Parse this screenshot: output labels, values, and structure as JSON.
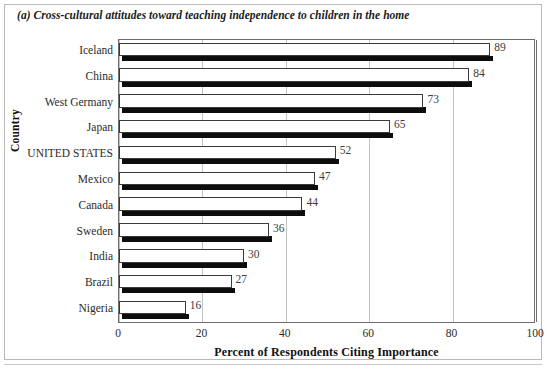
{
  "figure": {
    "caption": "(a) Cross-cultural attitudes toward teaching independence to children in the home"
  },
  "chart_data": {
    "type": "bar",
    "orientation": "horizontal",
    "title": "(a) Cross-cultural attitudes toward teaching independence to children in the home",
    "xlabel": "Percent of Respondents Citing Importance",
    "ylabel": "Country",
    "categories": [
      "Iceland",
      "China",
      "West Germany",
      "Japan",
      "UNITED STATES",
      "Mexico",
      "Canada",
      "Sweden",
      "India",
      "Brazil",
      "Nigeria"
    ],
    "values": [
      89,
      84,
      73,
      65,
      52,
      47,
      44,
      36,
      30,
      27,
      16
    ],
    "data_labels": [
      "89",
      "84",
      "73",
      "65",
      "52",
      "47",
      "44",
      "36",
      "30",
      "27",
      "16"
    ],
    "xlim": [
      0,
      100
    ],
    "xticks": [
      0,
      20,
      40,
      60,
      80,
      100
    ],
    "xtick_labels": [
      "0",
      "20",
      "40",
      "60",
      "80",
      "100"
    ],
    "grid": "vertical",
    "legend": "none",
    "bar_fill_color": "#ffffff",
    "bar_edge_color": "#3a3a3a",
    "bar_shadow_color": "#0d0d0d",
    "gridline_color": "#c2c2c2",
    "axis_color": "#6e6e6e",
    "plot_background": "#ffffff"
  }
}
